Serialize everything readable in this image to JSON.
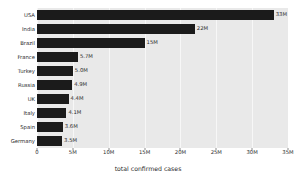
{
  "chart_data": {
    "type": "bar",
    "orientation": "horizontal",
    "title": "",
    "xlabel": "total confirmed cases",
    "ylabel": "",
    "categories": [
      "USA",
      "India",
      "Brazil",
      "France",
      "Turkey",
      "Russia",
      "UK",
      "Italy",
      "Spain",
      "Germany"
    ],
    "values": [
      33000000,
      22000000,
      15000000,
      5700000,
      5000000,
      4900000,
      4400000,
      4100000,
      3600000,
      3500000
    ],
    "value_labels": [
      "33M",
      "22M",
      "15M",
      "5.7M",
      "5.0M",
      "4.9M",
      "4.4M",
      "4.1M",
      "3.6M",
      "3.5M"
    ],
    "xlim": [
      0,
      35000000
    ],
    "xticks": [
      0,
      5000000,
      10000000,
      15000000,
      20000000,
      25000000,
      30000000,
      35000000
    ],
    "xticklabels": [
      "0",
      "5M",
      "10M",
      "15M",
      "20M",
      "25M",
      "30M",
      "35M"
    ],
    "grid": true,
    "legend": null,
    "bar_color": "#1b1b1b",
    "plot_background": "#e9e9e9",
    "figure_background": "#ffffff",
    "gridline_color": "#f7f7f7"
  }
}
